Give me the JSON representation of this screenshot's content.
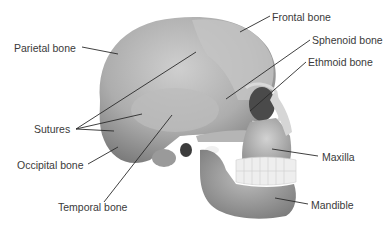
{
  "diagram": {
    "labels": [
      {
        "id": "frontal",
        "text": "Frontal bone",
        "x": 272,
        "y": 11,
        "points_to": [
          240,
          32
        ]
      },
      {
        "id": "parietal",
        "text": "Parietal bone",
        "x": 14,
        "y": 42,
        "points_to": [
          118,
          54
        ]
      },
      {
        "id": "sphenoid",
        "text": "Sphenoid bone",
        "x": 312,
        "y": 34,
        "points_to": [
          226,
          99
        ]
      },
      {
        "id": "ethmoid",
        "text": "Ethmoid bone",
        "x": 308,
        "y": 56,
        "points_to": [
          250,
          111
        ]
      },
      {
        "id": "sutures",
        "text": "Sutures",
        "x": 34,
        "y": 123,
        "points_to": [
          [
            196,
            52
          ],
          [
            142,
            114
          ],
          [
            114,
            131
          ]
        ]
      },
      {
        "id": "occipital",
        "text": "Occipital bone",
        "x": 17,
        "y": 159,
        "points_to": [
          118,
          147
        ]
      },
      {
        "id": "maxilla",
        "text": "Maxilla",
        "x": 322,
        "y": 151,
        "points_to": [
          272,
          149
        ]
      },
      {
        "id": "mandible",
        "text": "Mandible",
        "x": 311,
        "y": 199,
        "points_to": [
          275,
          198
        ]
      },
      {
        "id": "temporal",
        "text": "Temporal bone",
        "x": 58,
        "y": 201,
        "points_to": [
          172,
          115
        ]
      }
    ],
    "colors": {
      "bone_light": "#c9c9c9",
      "bone_mid": "#a8a8a8",
      "bone_dark": "#6e6e6e",
      "leader_line": "#2a2a2a",
      "text": "#3a3a3a",
      "teeth": "#f2f2f2"
    }
  }
}
